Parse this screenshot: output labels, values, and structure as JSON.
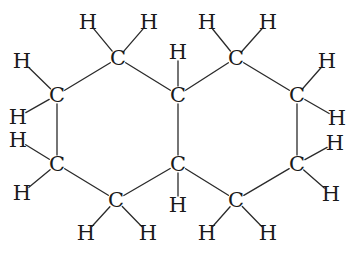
{
  "colors": {
    "bond": "#2a2a2a",
    "text": "#1a1a1a",
    "background": "#ffffff"
  },
  "atoms": [
    {
      "id": "C1",
      "label": "C",
      "x": 118,
      "y": 58
    },
    {
      "id": "C2",
      "label": "C",
      "x": 57,
      "y": 95
    },
    {
      "id": "C3",
      "label": "C",
      "x": 57,
      "y": 164
    },
    {
      "id": "C4",
      "label": "C",
      "x": 116,
      "y": 200
    },
    {
      "id": "C5",
      "label": "C",
      "x": 178,
      "y": 164
    },
    {
      "id": "C6",
      "label": "C",
      "x": 178,
      "y": 95
    },
    {
      "id": "C7",
      "label": "C",
      "x": 236,
      "y": 58
    },
    {
      "id": "C8",
      "label": "C",
      "x": 297,
      "y": 95
    },
    {
      "id": "C9",
      "label": "C",
      "x": 297,
      "y": 164
    },
    {
      "id": "C10",
      "label": "C",
      "x": 236,
      "y": 200
    },
    {
      "id": "H1a",
      "label": "H",
      "x": 88,
      "y": 22,
      "bonded_to": "C1"
    },
    {
      "id": "H1b",
      "label": "H",
      "x": 149,
      "y": 22,
      "bonded_to": "C1"
    },
    {
      "id": "H2a",
      "label": "H",
      "x": 22,
      "y": 61,
      "bonded_to": "C2"
    },
    {
      "id": "H2b",
      "label": "H",
      "x": 18,
      "y": 117,
      "bonded_to": "C2"
    },
    {
      "id": "H3a",
      "label": "H",
      "x": 18,
      "y": 140,
      "bonded_to": "C3"
    },
    {
      "id": "H3b",
      "label": "H",
      "x": 22,
      "y": 193,
      "bonded_to": "C3"
    },
    {
      "id": "H4a",
      "label": "H",
      "x": 86,
      "y": 233,
      "bonded_to": "C4"
    },
    {
      "id": "H4b",
      "label": "H",
      "x": 148,
      "y": 233,
      "bonded_to": "C4"
    },
    {
      "id": "H5",
      "label": "H",
      "x": 178,
      "y": 205,
      "bonded_to": "C5"
    },
    {
      "id": "H6",
      "label": "H",
      "x": 178,
      "y": 52,
      "bonded_to": "C6"
    },
    {
      "id": "H7a",
      "label": "H",
      "x": 207,
      "y": 22,
      "bonded_to": "C7"
    },
    {
      "id": "H7b",
      "label": "H",
      "x": 268,
      "y": 22,
      "bonded_to": "C7"
    },
    {
      "id": "H8a",
      "label": "H",
      "x": 327,
      "y": 61,
      "bonded_to": "C8"
    },
    {
      "id": "H8b",
      "label": "H",
      "x": 337,
      "y": 118,
      "bonded_to": "C8"
    },
    {
      "id": "H9a",
      "label": "H",
      "x": 335,
      "y": 143,
      "bonded_to": "C9"
    },
    {
      "id": "H9b",
      "label": "H",
      "x": 331,
      "y": 194,
      "bonded_to": "C9"
    },
    {
      "id": "H10a",
      "label": "H",
      "x": 207,
      "y": 233,
      "bonded_to": "C10"
    },
    {
      "id": "H10b",
      "label": "H",
      "x": 268,
      "y": 233,
      "bonded_to": "C10"
    }
  ],
  "ring_bonds": [
    [
      "C1",
      "C2"
    ],
    [
      "C2",
      "C3"
    ],
    [
      "C3",
      "C4"
    ],
    [
      "C4",
      "C5"
    ],
    [
      "C5",
      "C6"
    ],
    [
      "C6",
      "C1"
    ],
    [
      "C6",
      "C7"
    ],
    [
      "C7",
      "C8"
    ],
    [
      "C8",
      "C9"
    ],
    [
      "C9",
      "C10"
    ],
    [
      "C10",
      "C5"
    ]
  ]
}
